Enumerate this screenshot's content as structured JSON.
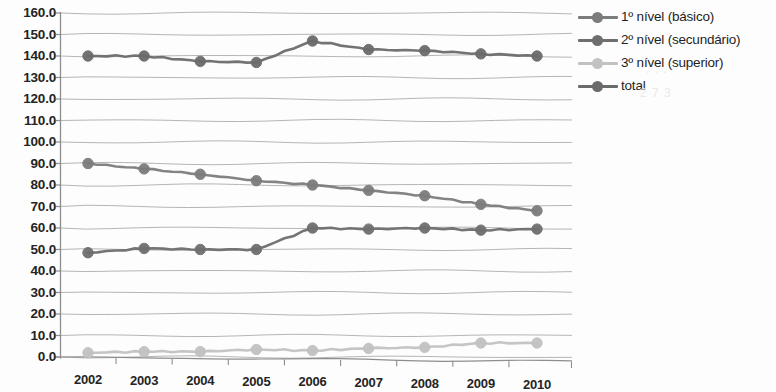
{
  "chart_data": {
    "type": "line",
    "title": "",
    "subtitle": "",
    "xlabel": "",
    "ylabel": "",
    "categories": [
      "2002",
      "2003",
      "2004",
      "2005",
      "2006",
      "2007",
      "2008",
      "2009",
      "2010"
    ],
    "x": [
      2002,
      2003,
      2004,
      2005,
      2006,
      2007,
      2008,
      2009,
      2010
    ],
    "ylim": [
      0.0,
      160.0
    ],
    "ytick_step": 10.0,
    "ytick_labels": [
      "160.0",
      "150.0",
      "140.0",
      "130.0",
      "120.0",
      "110.0",
      "100.0",
      "90.0",
      "80.0",
      "70.0",
      "60.0",
      "50.0",
      "40.0",
      "30.0",
      "20.0",
      "10.0",
      "0.0"
    ],
    "ytick_values": [
      160,
      150,
      140,
      130,
      120,
      110,
      100,
      90,
      80,
      70,
      60,
      50,
      40,
      30,
      20,
      10,
      0
    ],
    "grid": true,
    "grid_axis": "y",
    "legend_position": "right",
    "markers": "circle",
    "series": [
      {
        "name": "1º nível (básico)",
        "color": "#7c7c7c",
        "values": [
          90.0,
          87.5,
          85.0,
          82.0,
          80.0,
          77.5,
          75.0,
          71.0,
          68.0
        ]
      },
      {
        "name": "2º nível (secundário)",
        "color": "#6e6e6e",
        "values": [
          48.5,
          50.5,
          50.0,
          50.0,
          60.0,
          59.5,
          60.0,
          59.0,
          59.5
        ]
      },
      {
        "name": "3º nível (superior)",
        "color": "#c2c2c2",
        "values": [
          2.0,
          2.5,
          2.5,
          3.5,
          3.0,
          4.0,
          4.5,
          6.5,
          6.5
        ]
      },
      {
        "name": "total",
        "color": "#6b6b6b",
        "values": [
          140.0,
          140.0,
          137.5,
          137.0,
          147.0,
          143.0,
          142.5,
          141.0,
          140.0
        ]
      }
    ]
  },
  "legend": {
    "items": [
      {
        "label": "1º nível (básico)",
        "color": "#7c7c7c",
        "icon": "line-marker-icon"
      },
      {
        "label": "2º nível (secundário)",
        "color": "#6e6e6e",
        "icon": "line-marker-icon"
      },
      {
        "label": "3º nível (superior)",
        "color": "#c2c2c2",
        "icon": "line-marker-icon"
      },
      {
        "label": "total",
        "color": "#6b6b6b",
        "icon": "line-marker-icon"
      }
    ]
  },
  "axes": {
    "y_axis_color": "#8e8e8e",
    "x_axis_color": "#8e8e8e",
    "gridline_color": "#a8a8a8"
  }
}
